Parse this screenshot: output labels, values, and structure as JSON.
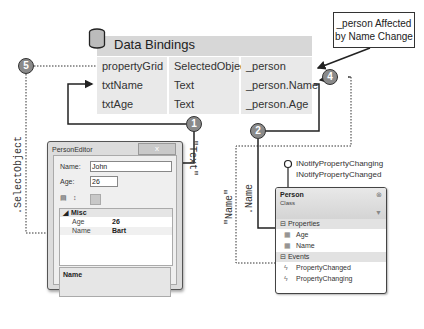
{
  "callout": {
    "line1": "_person Affected",
    "line2": "by Name Change"
  },
  "data_bindings": {
    "title": "Data Bindings",
    "icon": "database-icon",
    "rows": [
      {
        "control": "propertyGrid",
        "property": "SelectedObject",
        "path": "_person"
      },
      {
        "control": "txtName",
        "property": "Text",
        "path": "_person.Name"
      },
      {
        "control": "txtAge",
        "property": "Text",
        "path": "_person.Age"
      }
    ]
  },
  "badges": {
    "b1": "1",
    "b2": "2",
    "b3": "3",
    "b4": "4",
    "b5": "5"
  },
  "labels": {
    "select_object": ".SelectObject",
    "text": "\"Text\"",
    "name_quoted": "\"Name\"",
    "dot_name": ".Name"
  },
  "person_editor": {
    "title": "PersonEditor",
    "close": "x",
    "name_label": "Name:",
    "name_value": "John",
    "age_label": "Age:",
    "age_value": "26",
    "toolbar": {
      "categorized": "categorized-icon",
      "alphabetical": "alphabetical-icon",
      "pages": "property-pages-icon"
    },
    "grid": {
      "category": "Misc",
      "rows": [
        {
          "name": "Age",
          "value": "26"
        },
        {
          "name": "Name",
          "value": "Bart"
        }
      ]
    },
    "description_title": "Name"
  },
  "person_class": {
    "interfaces": [
      "INotifyPropertyChanging",
      "INotifyPropertyChanged"
    ],
    "name": "Person",
    "kind": "Class",
    "sections": [
      {
        "title": "Properties",
        "items": [
          "Age",
          "Name"
        ]
      },
      {
        "title": "Events",
        "items": [
          "PropertyChanged",
          "PropertyChanging"
        ]
      }
    ]
  }
}
